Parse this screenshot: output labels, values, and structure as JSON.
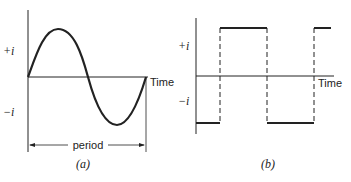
{
  "figure_a": {
    "caption": "(a)",
    "y_pos_label": "+i",
    "y_neg_label": "−i",
    "x_label": "Time",
    "period_label": "period",
    "waveform": "sine"
  },
  "figure_b": {
    "caption": "(b)",
    "y_pos_label": "+i",
    "y_neg_label": "−i",
    "x_label": "Time",
    "waveform": "square"
  },
  "colors": {
    "ink": "#222222",
    "background": "#ffffff"
  }
}
